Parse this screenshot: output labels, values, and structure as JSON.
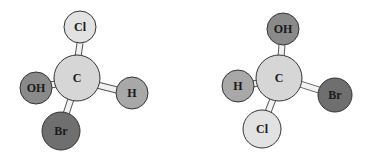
{
  "diagram": {
    "molecules": [
      {
        "name": "molecule-left",
        "center": {
          "label": "C",
          "x": 77,
          "y": 78,
          "r": 23,
          "color": "#d6d6d6"
        },
        "atoms": [
          {
            "label": "Cl",
            "x": 80,
            "y": 27,
            "r": 16,
            "color": "#e2e2e2"
          },
          {
            "label": "OH",
            "x": 36,
            "y": 88,
            "r": 16,
            "color": "#8a8a8a"
          },
          {
            "label": "H",
            "x": 132,
            "y": 93,
            "r": 16,
            "color": "#a8a8a8"
          },
          {
            "label": "Br",
            "x": 61,
            "y": 131,
            "r": 19,
            "color": "#6f6f6f"
          }
        ]
      },
      {
        "name": "molecule-right",
        "center": {
          "label": "C",
          "x": 279,
          "y": 78,
          "r": 23,
          "color": "#d6d6d6"
        },
        "atoms": [
          {
            "label": "OH",
            "x": 283,
            "y": 29,
            "r": 16,
            "color": "#8a8a8a"
          },
          {
            "label": "H",
            "x": 238,
            "y": 86,
            "r": 16,
            "color": "#a8a8a8"
          },
          {
            "label": "Br",
            "x": 335,
            "y": 95,
            "r": 17,
            "color": "#6f6f6f"
          },
          {
            "label": "Cl",
            "x": 262,
            "y": 129,
            "r": 19,
            "color": "#e2e2e2"
          }
        ]
      }
    ]
  }
}
